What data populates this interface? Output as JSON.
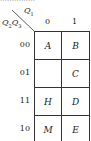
{
  "top_text": "……………",
  "header": {
    "col_var": "Q",
    "col_var_sub": "1",
    "row_var": "Q",
    "row_var_sub1": "2",
    "row_var2": "Q",
    "row_var_sub2": "3"
  },
  "columns": [
    "0",
    "1"
  ],
  "rows": [
    {
      "label": "00",
      "cells": [
        "A",
        "B"
      ]
    },
    {
      "label": "01",
      "cells": [
        "",
        "C"
      ]
    },
    {
      "label": "11",
      "cells": [
        "H",
        "D"
      ]
    },
    {
      "label": "10",
      "cells": [
        "M",
        "E"
      ]
    }
  ]
}
